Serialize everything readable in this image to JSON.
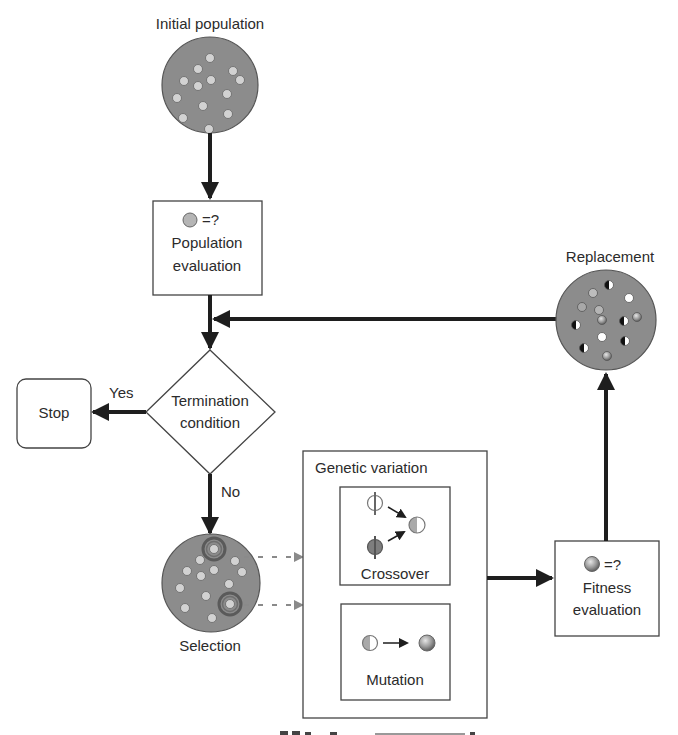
{
  "diagram": {
    "type": "flowchart",
    "colors": {
      "population_fill": "#8c8c8c",
      "individual_fill": "#d2d2d2",
      "line": "#1e1e1e",
      "dashed_arrow": "#8a8a8a",
      "box_border": "#444444"
    },
    "nodes": {
      "initial_population": {
        "label": "Initial population"
      },
      "population_evaluation": {
        "symbol": "=?",
        "label_line1": "Population",
        "label_line2": "evaluation"
      },
      "termination": {
        "label_line1": "Termination",
        "label_line2": "condition"
      },
      "stop": {
        "label": "Stop"
      },
      "selection": {
        "label": "Selection"
      },
      "genetic_variation": {
        "label": "Genetic variation",
        "crossover": {
          "label": "Crossover"
        },
        "mutation": {
          "label": "Mutation"
        }
      },
      "fitness_evaluation": {
        "symbol": "=?",
        "label_line1": "Fitness",
        "label_line2": "evaluation"
      },
      "replacement": {
        "label": "Replacement"
      }
    },
    "edges": {
      "yes_label": "Yes",
      "no_label": "No"
    },
    "caption_truncated": "Figure (caption cut off at bottom edge)"
  }
}
